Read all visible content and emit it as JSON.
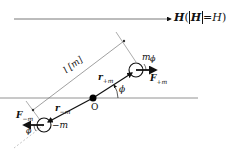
{
  "diagram": {
    "field_label": {
      "vector": "H",
      "paren_open": "(",
      "abs_inner": "H",
      "equals": "=",
      "scalar": "H",
      "paren_close": ")"
    },
    "length_label": "l [m]",
    "origin_label": "O",
    "r_plus": {
      "symbol": "r",
      "subscript": "+m"
    },
    "r_minus": {
      "symbol": "r",
      "subscript": "−m"
    },
    "m_plus": {
      "symbol": "m",
      "subscript": ""
    },
    "m_minus": {
      "symbol": "−m"
    },
    "F_plus": {
      "symbol": "F",
      "subscript": "+m"
    },
    "F_minus": {
      "symbol": "F",
      "subscript": "−m"
    },
    "angle_label": "ϕ",
    "colors": {
      "line": "#111111",
      "light_line": "#888888",
      "dashed": "#aaaaaa"
    }
  }
}
